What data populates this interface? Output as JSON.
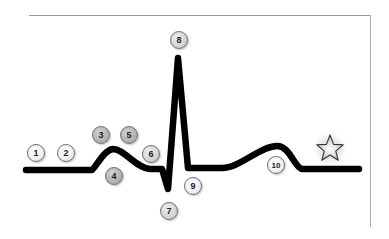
{
  "diagram": {
    "type": "ecg-waveform",
    "line_color": "#000000",
    "frame_color": "#9a9a9a",
    "markers": [
      {
        "label": "1",
        "x": 36,
        "y": 153,
        "shade": "light"
      },
      {
        "label": "2",
        "x": 66,
        "y": 153,
        "shade": "light"
      },
      {
        "label": "3",
        "x": 101,
        "y": 135,
        "shade": "dark"
      },
      {
        "label": "4",
        "x": 114,
        "y": 176,
        "shade": "dark"
      },
      {
        "label": "5",
        "x": 129,
        "y": 135,
        "shade": "dark"
      },
      {
        "label": "6",
        "x": 151,
        "y": 154,
        "shade": "mid"
      },
      {
        "label": "7",
        "x": 169,
        "y": 211,
        "shade": "mid"
      },
      {
        "label": "8",
        "x": 179,
        "y": 40,
        "shade": "mid"
      },
      {
        "label": "9",
        "x": 193,
        "y": 186,
        "shade": "light"
      },
      {
        "label": "10",
        "x": 276,
        "y": 165,
        "shade": "light"
      }
    ],
    "star": {
      "x": 330,
      "y": 148,
      "label": "star-icon"
    }
  }
}
